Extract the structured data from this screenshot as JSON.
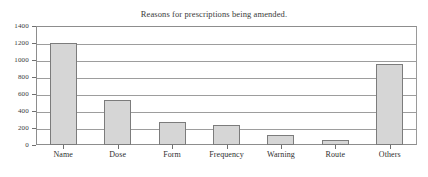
{
  "chart_data": {
    "type": "bar",
    "title": "Reasons for prescriptions being amended.",
    "xlabel": "",
    "ylabel": "",
    "categories": [
      "Name",
      "Dose",
      "Form",
      "Frequency",
      "Warning",
      "Route",
      "Others"
    ],
    "values": [
      1205,
      525,
      265,
      230,
      120,
      55,
      955
    ],
    "ylim": [
      0,
      1400
    ],
    "ytick_labels": [
      "0",
      "200",
      "400",
      "600",
      "800",
      "1000",
      "1200",
      "1400"
    ],
    "ytick_values": [
      0,
      200,
      400,
      600,
      800,
      1000,
      1200,
      1400
    ],
    "grid": true,
    "legend": false,
    "legend_position": "none",
    "bar_fill_color": "#d6d6d6",
    "bar_edge_color": "#7c7c7c",
    "grid_color": "#9d9d9d",
    "frame_color": "#8d8d8d",
    "text_color": "#2f2f2f"
  }
}
